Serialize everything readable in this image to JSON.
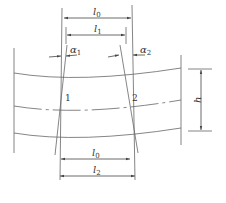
{
  "diagram": {
    "type": "engineering-dimension-drawing",
    "colors": {
      "line": "#555555",
      "text": "#333333",
      "background": "#ffffff"
    },
    "labels": {
      "l0_top": {
        "base": "l",
        "sub": "0"
      },
      "l1": {
        "base": "l",
        "sub": "1"
      },
      "alpha1": {
        "base": "α",
        "sub": "1"
      },
      "alpha2": {
        "base": "α",
        "sub": "2"
      },
      "h": {
        "base": "h"
      },
      "marker1": "1",
      "marker2": "2",
      "l0_bottom": {
        "base": "l",
        "sub": "0"
      },
      "l2": {
        "base": "l",
        "sub": "2"
      }
    }
  }
}
